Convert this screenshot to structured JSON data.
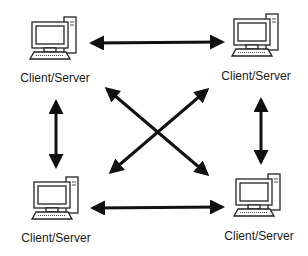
{
  "diagram": {
    "colors": {
      "stroke": "#111111",
      "background": "#ffffff"
    },
    "nodes": [
      {
        "id": "top-left",
        "label": "Client/Server",
        "icon": "desktop-computer-icon"
      },
      {
        "id": "top-right",
        "label": "Client/Server",
        "icon": "desktop-computer-icon"
      },
      {
        "id": "bottom-left",
        "label": "Client/Server",
        "icon": "desktop-computer-icon"
      },
      {
        "id": "bottom-right",
        "label": "Client/Server",
        "icon": "desktop-computer-icon"
      }
    ],
    "edges": [
      {
        "from": "top-left",
        "to": "top-right",
        "type": "bidirectional-arrow"
      },
      {
        "from": "bottom-left",
        "to": "bottom-right",
        "type": "bidirectional-arrow"
      },
      {
        "from": "top-left",
        "to": "bottom-left",
        "type": "bidirectional-arrow"
      },
      {
        "from": "top-right",
        "to": "bottom-right",
        "type": "bidirectional-arrow"
      },
      {
        "from": "top-left",
        "to": "bottom-right",
        "type": "bidirectional-arrow"
      },
      {
        "from": "top-right",
        "to": "bottom-left",
        "type": "bidirectional-arrow"
      }
    ]
  }
}
